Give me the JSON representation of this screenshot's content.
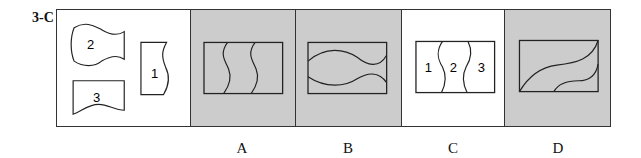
{
  "question": {
    "label": "3-C"
  },
  "colors": {
    "shaded": "#cccccc",
    "white": "#ffffff",
    "stroke": "#222222"
  },
  "pieces": {
    "labels": [
      "1",
      "2",
      "3"
    ]
  },
  "options": [
    {
      "label": "A",
      "shaded": true
    },
    {
      "label": "B",
      "shaded": true
    },
    {
      "label": "C",
      "shaded": false,
      "region_labels": [
        "1",
        "2",
        "3"
      ]
    },
    {
      "label": "D",
      "shaded": true
    }
  ]
}
